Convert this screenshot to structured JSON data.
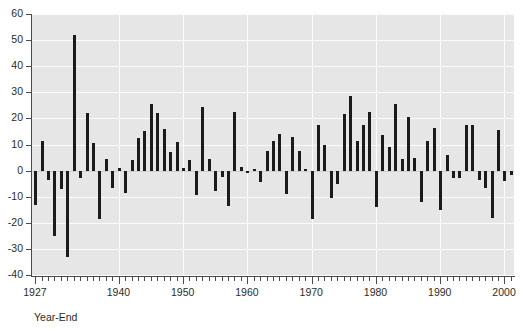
{
  "chart_data": {
    "type": "bar",
    "title": "",
    "subtitle": "",
    "xlabel": "Year-End",
    "ylabel": "",
    "xlim": [
      1926.5,
      2001.5
    ],
    "ylim": [
      -40,
      60
    ],
    "grid": true,
    "legend": "none",
    "y_ticks": [
      60,
      50,
      40,
      30,
      20,
      10,
      0,
      -10,
      -20,
      -30,
      -40
    ],
    "y_tick_labels": [
      "60",
      "50",
      "40",
      "30",
      "20",
      "10",
      "0",
      "-10",
      "-20",
      "-30",
      "-40"
    ],
    "x_tick_labels": [
      "1927",
      "1940",
      "1950",
      "1960",
      "1970",
      "1980",
      "1990",
      "2000"
    ],
    "x_tick_values": [
      1927,
      1940,
      1950,
      1960,
      1970,
      1980,
      1990,
      2000
    ],
    "x_minor_tick_step": 1,
    "bar_color": "#1b1b1b",
    "plot_background": "#e6e6e6",
    "gridline_color": "#fbfbfb",
    "categories": [
      1927,
      1928,
      1929,
      1930,
      1931,
      1932,
      1933,
      1934,
      1935,
      1936,
      1937,
      1938,
      1939,
      1940,
      1941,
      1942,
      1943,
      1944,
      1945,
      1946,
      1947,
      1948,
      1949,
      1950,
      1951,
      1952,
      1953,
      1954,
      1955,
      1956,
      1957,
      1958,
      1959,
      1960,
      1961,
      1962,
      1963,
      1964,
      1965,
      1966,
      1967,
      1968,
      1969,
      1970,
      1971,
      1972,
      1973,
      1974,
      1975,
      1976,
      1977,
      1978,
      1979,
      1980,
      1981,
      1982,
      1983,
      1984,
      1985,
      1986,
      1987,
      1988,
      1989,
      1990,
      1991,
      1992,
      1993,
      1994,
      1995,
      1996,
      1997,
      1998,
      1999,
      2000,
      2001
    ],
    "values": [
      -13.0,
      11.5,
      -3.5,
      -25.0,
      -7.0,
      -33.0,
      52.0,
      -3.0,
      22.0,
      10.5,
      -18.5,
      4.5,
      -6.5,
      1.0,
      -8.5,
      4.0,
      12.5,
      15.0,
      25.5,
      22.0,
      16.0,
      7.0,
      11.0,
      1.0,
      4.0,
      -9.5,
      24.5,
      4.5,
      -8.0,
      -2.5,
      -13.5,
      22.5,
      1.5,
      -1.0,
      0.5,
      -4.5,
      7.5,
      11.5,
      14.0,
      -9.0,
      13.0,
      7.5,
      0.5,
      -18.5,
      17.5,
      10.0,
      -10.5,
      -5.0,
      21.5,
      28.5,
      11.5,
      17.5,
      22.5,
      -14.0,
      13.5,
      9.0,
      25.5,
      4.5,
      20.5,
      5.0,
      -12.0,
      11.5,
      16.5,
      -15.0,
      6.0,
      -3.0,
      -3.0,
      17.5,
      17.5,
      -3.5,
      -6.5,
      -18.0,
      15.5,
      -4.0,
      -1.5
    ]
  }
}
